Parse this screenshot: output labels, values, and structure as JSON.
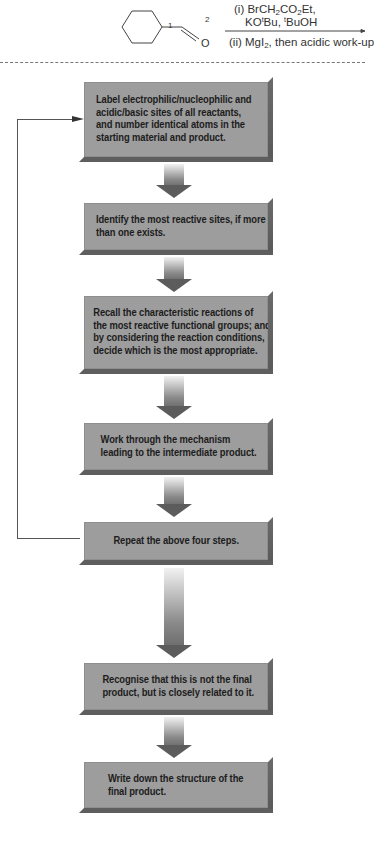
{
  "reaction": {
    "atom_labels": [
      "1",
      "2"
    ],
    "carbonyl_oxygen": "O",
    "reagents_above": {
      "line1_prefix": "(i) BrCH",
      "line1_sub1": "2",
      "line1_mid": "CO",
      "line1_sub2": "2",
      "line1_suffix": "Et,",
      "line2_a": "KO",
      "line2_sup1": "t",
      "line2_b": "Bu, ",
      "line2_sup2": "t",
      "line2_c": "BuOH"
    },
    "reagents_below": {
      "prefix": "(ii) MgI",
      "sub": "2",
      "suffix": ", then acidic work-up"
    }
  },
  "flowchart": {
    "steps": [
      {
        "lines": [
          "Label electrophilic/nucleophilic and",
          "acidic/basic sites of all reactants,",
          "and number identical atoms in the",
          "starting material and product."
        ]
      },
      {
        "lines": [
          "Identify the most reactive sites, if more",
          "than one exists."
        ]
      },
      {
        "lines": [
          "Recall the characteristic reactions of",
          "the most reactive functional groups; and",
          "by considering the reaction conditions,",
          "decide which is the most appropriate."
        ]
      },
      {
        "lines": [
          "Work through the mechanism",
          "leading to the intermediate product."
        ]
      },
      {
        "lines": [
          "Repeat the above four steps."
        ]
      },
      {
        "lines": [
          "Recognise that this is not the final",
          "product, but is closely related to it."
        ]
      },
      {
        "lines": [
          "Write down the structure of the",
          "final product."
        ]
      }
    ]
  },
  "colors": {
    "box_fill": "#9d9d9d",
    "box_shadow": "#5e5e5e",
    "arrow_head": "#5c5c5c",
    "loop_line": "#555555"
  }
}
